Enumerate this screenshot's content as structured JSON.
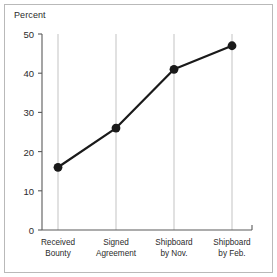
{
  "figure": {
    "axis_title": "Percent",
    "background_color": "#ffffff",
    "frame_color": "#b9b9b9",
    "gridline_color": "#c8c8c8",
    "axis_color": "#5a5a5a",
    "series_color": "#1a1a1a"
  },
  "chart_data": {
    "type": "line",
    "title": "",
    "subtitle": "",
    "xlabel": "",
    "ylabel": "Percent",
    "categories": [
      "Received Bounty",
      "Signed Agreement",
      "Shipboard by Nov.",
      "Shipboard by Feb."
    ],
    "category_lines": [
      [
        "Received",
        "Bounty"
      ],
      [
        "Signed",
        "Agreement"
      ],
      [
        "Shipboard",
        "by Nov."
      ],
      [
        "Shipboard",
        "by Feb."
      ]
    ],
    "values": [
      16,
      26,
      41,
      47
    ],
    "ylim": [
      0,
      50
    ],
    "yticks": [
      0,
      10,
      20,
      30,
      40,
      50
    ],
    "ytick_labels": [
      "0",
      "10",
      "20",
      "30",
      "40",
      "50"
    ],
    "grid": "vertical-only",
    "legend": "none",
    "markers": "filled-circle",
    "annotations": []
  }
}
